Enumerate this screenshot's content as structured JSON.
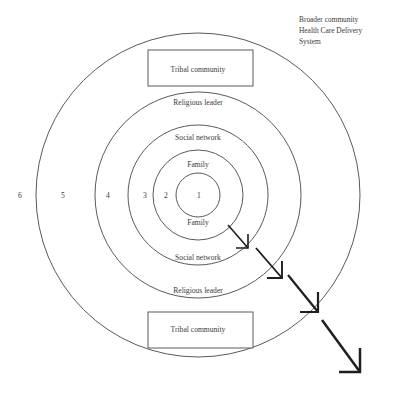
{
  "figure": {
    "corner_note": {
      "lines": [
        "Broader community",
        "Health Care Delivery",
        "System"
      ]
    },
    "rings": [
      {
        "number": "1",
        "label": "",
        "number_x": 199,
        "radius": 22
      },
      {
        "number": "2",
        "label": "Family",
        "number_x": 166,
        "radius": 45
      },
      {
        "number": "3",
        "label": "Social network",
        "number_x": 145,
        "radius": 70
      },
      {
        "number": "4",
        "label": "Religious leader",
        "number_x": 108,
        "radius": 103
      },
      {
        "number": "5",
        "label": "Tribal community",
        "number_x": 63,
        "radius": 162
      },
      {
        "number": "6",
        "label": "",
        "number_x": 20,
        "radius": 0
      }
    ],
    "boxes": [
      {
        "label": "Tribal community",
        "position": "top"
      },
      {
        "label": "Tribal community",
        "position": "bottom"
      }
    ],
    "labels_top": [
      {
        "text": "Tribal community",
        "y": 70
      },
      {
        "text": "Religious leader",
        "y": 103
      },
      {
        "text": "Social network",
        "y": 138
      },
      {
        "text": "Family",
        "y": 165
      }
    ],
    "labels_bottom": [
      {
        "text": "Family",
        "y": 223
      },
      {
        "text": "Social network",
        "y": 258
      },
      {
        "text": "Religious leader",
        "y": 291
      },
      {
        "text": "Tribal community",
        "y": 330
      }
    ],
    "arrows": [
      {
        "x1": 228,
        "y1": 225,
        "x2": 248,
        "y2": 248,
        "width": 1.6
      },
      {
        "x1": 256,
        "y1": 248,
        "x2": 282,
        "y2": 278,
        "width": 1.9
      },
      {
        "x1": 288,
        "y1": 275,
        "x2": 318,
        "y2": 312,
        "width": 2.2
      },
      {
        "x1": 322,
        "y1": 320,
        "x2": 360,
        "y2": 372,
        "width": 2.5
      }
    ],
    "colors": {
      "stroke": "#5a5a5a",
      "arrow": "#1f1f1f",
      "text": "#3a3a3a",
      "background": "#ffffff"
    },
    "geometry": {
      "center_x": 198,
      "center_y": 195
    }
  }
}
